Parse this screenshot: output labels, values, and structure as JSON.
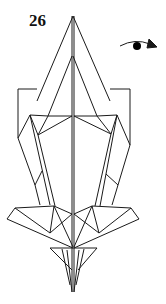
{
  "step": {
    "number": "26"
  },
  "symbols": [
    {
      "type": "turn-over-arrow",
      "description": "Turn model over"
    }
  ],
  "colors": {
    "line": "#1a1a1a",
    "background": "#ffffff"
  }
}
